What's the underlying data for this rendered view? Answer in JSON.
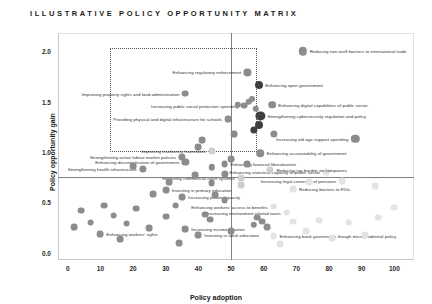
{
  "title": "ILLUSTRATIVE POLICY OPPORTUNITY MATRIX",
  "chart_data": {
    "type": "scatter",
    "title": "ILLUSTRATIVE POLICY OPPORTUNITY MATRIX",
    "xlabel": "Policy adoption",
    "ylabel": "Policy opportunity gain",
    "xlim": [
      -3,
      106
    ],
    "ylim": [
      -0.07,
      2.18
    ],
    "xticks": [
      0,
      10,
      20,
      30,
      40,
      50,
      60,
      70,
      80,
      90,
      100
    ],
    "yticks": [
      "0.0",
      "0.5",
      "1.0",
      "1.5",
      "2.0"
    ],
    "grid": false,
    "legend": null,
    "reference_lines": {
      "vertical_x": 50,
      "horizontal_y": 0.75
    },
    "highlight_box": {
      "x0": 13,
      "x1": 58,
      "y0": 1.0,
      "y1": 2.03
    },
    "colors": {
      "dark": "#3f3f3f",
      "mid": "#8c8c8c",
      "light": "#cfcfcf",
      "faint": "#e3e3e3",
      "axis": "#c8c8c8",
      "ref": "#7f7f7f"
    },
    "points": [
      {
        "label": "Reducing non-tariff barriers to international trade",
        "x": 72,
        "y": 2.0,
        "r": 4.2,
        "tone": "mid",
        "side": "right"
      },
      {
        "label": "Enhancing regulatory enforcement",
        "x": 55,
        "y": 1.79,
        "r": 3.6,
        "tone": "mid",
        "side": "left"
      },
      {
        "label": "Enhancing open government",
        "x": 58.5,
        "y": 1.66,
        "r": 4.0,
        "tone": "dark",
        "side": "right"
      },
      {
        "label": "Improving property rights and land administration",
        "x": 36,
        "y": 1.58,
        "r": 3.4,
        "tone": "mid",
        "side": "left"
      },
      {
        "label": "Increasing public social protection spending",
        "x": 54,
        "y": 1.46,
        "r": 3.4,
        "tone": "mid",
        "side": "left"
      },
      {
        "label": "Enhancing digital capabilities of public sector",
        "x": 62.5,
        "y": 1.47,
        "r": 3.8,
        "tone": "mid",
        "side": "right"
      },
      {
        "label": "Strengthening cybersecurity regulation and policy",
        "x": 59,
        "y": 1.36,
        "r": 4.6,
        "tone": "dark",
        "side": "right"
      },
      {
        "label": "Providing physical and digital infrastructure for schools",
        "x": 49,
        "y": 1.33,
        "r": 3.4,
        "tone": "mid",
        "side": "left"
      },
      {
        "label": "Increasing old age support spending",
        "x": 88,
        "y": 1.13,
        "r": 4.2,
        "tone": "mid",
        "side": "left"
      },
      {
        "label": "Improving insolvency framework",
        "x": 44,
        "y": 1.01,
        "r": 3.6,
        "tone": "light",
        "side": "left"
      },
      {
        "label": "Enhancing accountability of government",
        "x": 59,
        "y": 0.99,
        "r": 3.8,
        "tone": "mid",
        "side": "right"
      },
      {
        "label": "Strengthening active labour market policies",
        "x": 35,
        "y": 0.95,
        "r": 3.6,
        "tone": "mid",
        "side": "left"
      },
      {
        "label": "Enhancing decentralisation of government",
        "x": 36,
        "y": 0.9,
        "r": 3.6,
        "tone": "mid",
        "side": "left"
      },
      {
        "label": "Enhancing financial liberalization",
        "x": 48,
        "y": 0.88,
        "r": 3.4,
        "tone": "mid",
        "side": "right"
      },
      {
        "label": "Strengthening health infrastructure",
        "x": 23,
        "y": 0.83,
        "r": 3.6,
        "tone": "mid",
        "side": "left"
      },
      {
        "label": "Enhancing statistical capacity of public sector",
        "x": 79,
        "y": 0.8,
        "r": 3.4,
        "tone": "faint",
        "side": "left"
      },
      {
        "label": "Improving commercial court systems",
        "x": 53,
        "y": 0.74,
        "r": 3.4,
        "tone": "light",
        "side": "left"
      },
      {
        "label": "Increasing legal coverage of pensions",
        "x": 84,
        "y": 0.71,
        "r": 3.4,
        "tone": "faint",
        "side": "left"
      },
      {
        "label": "Reducing tax burden on companies",
        "x": 62,
        "y": 0.82,
        "r": 3.6,
        "tone": "light",
        "side": "right"
      },
      {
        "label": "Reducing barriers to FDIs",
        "x": 69,
        "y": 0.63,
        "r": 3.4,
        "tone": "faint",
        "side": "right"
      },
      {
        "label": "Investing in primary education",
        "x": 30,
        "y": 0.62,
        "r": 3.4,
        "tone": "mid",
        "side": "right"
      },
      {
        "label": "Increasing prison capacity",
        "x": 35,
        "y": 0.55,
        "r": 3.4,
        "tone": "mid",
        "side": "right"
      },
      {
        "label": "Enhancing workers' access to benefits",
        "x": 63,
        "y": 0.46,
        "r": 3.4,
        "tone": "faint",
        "side": "left"
      },
      {
        "label": "Increasing environment related taxes",
        "x": 67,
        "y": 0.4,
        "r": 3.4,
        "tone": "faint",
        "side": "left"
      },
      {
        "label": "Increasing income taxation",
        "x": 36,
        "y": 0.24,
        "r": 3.4,
        "tone": "mid",
        "side": "right"
      },
      {
        "label": "Enhancing bank governance though microprudential policy",
        "x": 63,
        "y": 0.17,
        "r": 3.4,
        "tone": "faint",
        "side": "right"
      },
      {
        "label": "Enhancing workers' rights",
        "x": 10,
        "y": 0.19,
        "r": 3.4,
        "tone": "mid",
        "side": "right"
      },
      {
        "label": "Investing in adult education",
        "x": 40,
        "y": 0.18,
        "r": 3.4,
        "tone": "mid",
        "side": "right"
      },
      {
        "label": "",
        "x": 52,
        "y": 1.47,
        "r": 3.2,
        "tone": "mid",
        "side": "right"
      },
      {
        "label": "",
        "x": 55.5,
        "y": 1.5,
        "r": 3.2,
        "tone": "mid",
        "side": "right"
      },
      {
        "label": "",
        "x": 56.5,
        "y": 1.53,
        "r": 3.0,
        "tone": "mid",
        "side": "right"
      },
      {
        "label": "",
        "x": 57.5,
        "y": 1.43,
        "r": 3.2,
        "tone": "mid",
        "side": "right"
      },
      {
        "label": "",
        "x": 58.5,
        "y": 1.27,
        "r": 4.0,
        "tone": "dark",
        "side": "right"
      },
      {
        "label": "",
        "x": 57,
        "y": 1.22,
        "r": 3.6,
        "tone": "dark",
        "side": "right"
      },
      {
        "label": "",
        "x": 63,
        "y": 1.18,
        "r": 3.6,
        "tone": "mid",
        "side": "right"
      },
      {
        "label": "",
        "x": 51,
        "y": 1.18,
        "r": 3.4,
        "tone": "mid",
        "side": "right"
      },
      {
        "label": "",
        "x": 41,
        "y": 1.12,
        "r": 3.4,
        "tone": "mid",
        "side": "right"
      },
      {
        "label": "",
        "x": 40,
        "y": 1.05,
        "r": 3.4,
        "tone": "mid",
        "side": "right"
      },
      {
        "label": "",
        "x": 50,
        "y": 0.93,
        "r": 3.4,
        "tone": "mid",
        "side": "right"
      },
      {
        "label": "",
        "x": 55,
        "y": 0.88,
        "r": 3.4,
        "tone": "mid",
        "side": "right"
      },
      {
        "label": "",
        "x": 44,
        "y": 0.85,
        "r": 3.2,
        "tone": "mid",
        "side": "right"
      },
      {
        "label": "",
        "x": 20,
        "y": 0.86,
        "r": 3.4,
        "tone": "mid",
        "side": "right"
      },
      {
        "label": "",
        "x": 39,
        "y": 0.77,
        "r": 3.4,
        "tone": "mid",
        "side": "right"
      },
      {
        "label": "",
        "x": 48,
        "y": 0.78,
        "r": 3.6,
        "tone": "mid",
        "side": "right"
      },
      {
        "label": "",
        "x": 31,
        "y": 0.7,
        "r": 3.4,
        "tone": "mid",
        "side": "right"
      },
      {
        "label": "",
        "x": 44,
        "y": 0.69,
        "r": 3.4,
        "tone": "mid",
        "side": "right"
      },
      {
        "label": "",
        "x": 53,
        "y": 0.67,
        "r": 3.4,
        "tone": "light",
        "side": "right"
      },
      {
        "label": "",
        "x": 74,
        "y": 0.7,
        "r": 3.4,
        "tone": "faint",
        "side": "right"
      },
      {
        "label": "",
        "x": 94,
        "y": 0.66,
        "r": 3.4,
        "tone": "faint",
        "side": "right"
      },
      {
        "label": "",
        "x": 26,
        "y": 0.58,
        "r": 3.4,
        "tone": "mid",
        "side": "right"
      },
      {
        "label": "",
        "x": 45,
        "y": 0.57,
        "r": 3.4,
        "tone": "mid",
        "side": "right"
      },
      {
        "label": "",
        "x": 48,
        "y": 0.52,
        "r": 3.4,
        "tone": "mid",
        "side": "right"
      },
      {
        "label": "",
        "x": 33,
        "y": 0.47,
        "r": 3.4,
        "tone": "mid",
        "side": "right"
      },
      {
        "label": "",
        "x": 21,
        "y": 0.44,
        "r": 3.4,
        "tone": "mid",
        "side": "right"
      },
      {
        "label": "",
        "x": 11,
        "y": 0.47,
        "r": 3.4,
        "tone": "mid",
        "side": "right"
      },
      {
        "label": "",
        "x": 4,
        "y": 0.42,
        "r": 3.4,
        "tone": "mid",
        "side": "right"
      },
      {
        "label": "",
        "x": 14,
        "y": 0.37,
        "r": 3.4,
        "tone": "mid",
        "side": "right"
      },
      {
        "label": "",
        "x": 30,
        "y": 0.36,
        "r": 3.4,
        "tone": "mid",
        "side": "right"
      },
      {
        "label": "",
        "x": 42,
        "y": 0.38,
        "r": 3.4,
        "tone": "mid",
        "side": "right"
      },
      {
        "label": "",
        "x": 43.5,
        "y": 0.33,
        "r": 3.4,
        "tone": "mid",
        "side": "right"
      },
      {
        "label": "",
        "x": 58,
        "y": 0.35,
        "r": 3.4,
        "tone": "mid",
        "side": "right"
      },
      {
        "label": "",
        "x": 59.5,
        "y": 0.31,
        "r": 3.4,
        "tone": "mid",
        "side": "right"
      },
      {
        "label": "",
        "x": 61,
        "y": 0.26,
        "r": 3.4,
        "tone": "mid",
        "side": "right"
      },
      {
        "label": "",
        "x": 57,
        "y": 0.28,
        "r": 3.2,
        "tone": "mid",
        "side": "right"
      },
      {
        "label": "",
        "x": 7,
        "y": 0.3,
        "r": 3.4,
        "tone": "mid",
        "side": "right"
      },
      {
        "label": "",
        "x": 18,
        "y": 0.29,
        "r": 3.4,
        "tone": "mid",
        "side": "right"
      },
      {
        "label": "",
        "x": 2,
        "y": 0.26,
        "r": 3.4,
        "tone": "mid",
        "side": "right"
      },
      {
        "label": "",
        "x": 25,
        "y": 0.25,
        "r": 3.4,
        "tone": "mid",
        "side": "right"
      },
      {
        "label": "",
        "x": 50,
        "y": 0.22,
        "r": 3.4,
        "tone": "mid",
        "side": "right"
      },
      {
        "label": "",
        "x": 69,
        "y": 0.31,
        "r": 3.4,
        "tone": "faint",
        "side": "right"
      },
      {
        "label": "",
        "x": 77,
        "y": 0.32,
        "r": 3.4,
        "tone": "faint",
        "side": "right"
      },
      {
        "label": "",
        "x": 86,
        "y": 0.3,
        "r": 3.4,
        "tone": "faint",
        "side": "right"
      },
      {
        "label": "",
        "x": 95,
        "y": 0.35,
        "r": 3.4,
        "tone": "faint",
        "side": "right"
      },
      {
        "label": "",
        "x": 73,
        "y": 0.22,
        "r": 3.4,
        "tone": "faint",
        "side": "right"
      },
      {
        "label": "",
        "x": 81,
        "y": 0.15,
        "r": 3.4,
        "tone": "faint",
        "side": "right"
      },
      {
        "label": "",
        "x": 91,
        "y": 0.18,
        "r": 3.4,
        "tone": "faint",
        "side": "right"
      },
      {
        "label": "",
        "x": 65,
        "y": 0.09,
        "r": 3.4,
        "tone": "faint",
        "side": "right"
      },
      {
        "label": "",
        "x": 100,
        "y": 0.45,
        "r": 3.4,
        "tone": "faint",
        "side": "right"
      },
      {
        "label": "",
        "x": 16,
        "y": 0.14,
        "r": 3.4,
        "tone": "mid",
        "side": "right"
      },
      {
        "label": "",
        "x": 34,
        "y": 0.1,
        "r": 3.4,
        "tone": "mid",
        "side": "right"
      }
    ]
  }
}
